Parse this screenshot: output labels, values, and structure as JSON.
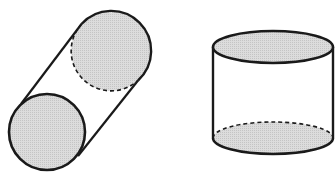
{
  "figure": {
    "colors": {
      "stroke": "#1a1a1a",
      "fill": "#d6d6d6",
      "background": "#ffffff"
    },
    "shapes": [
      {
        "name": "tilted-cylinder",
        "bottom_face": {
          "cx": 47,
          "cy": 132,
          "r": 38
        },
        "top_face": {
          "cx": 111,
          "cy": 51,
          "r": 40
        },
        "hidden_edge": "dashed lower-left arc of top face"
      },
      {
        "name": "upright-cylinder",
        "top_face": {
          "cx": 273,
          "cy": 47,
          "rx": 60,
          "ry": 16
        },
        "bottom_face": {
          "cx": 273,
          "cy": 138,
          "rx": 60,
          "ry": 16
        },
        "hidden_edge": "dashed back half of bottom face"
      }
    ]
  }
}
